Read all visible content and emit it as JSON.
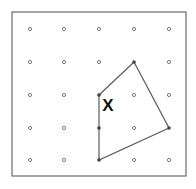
{
  "diagram": {
    "type": "dot-grid-polygon",
    "frame": {
      "x": 12,
      "y": 12,
      "width": 174,
      "height": 164,
      "stroke": "#6a6a6a"
    },
    "grid": {
      "cols": 5,
      "rows": 5,
      "xs": [
        30,
        64,
        99,
        134,
        169
      ],
      "ys": [
        29,
        62,
        95,
        128,
        160
      ],
      "dot_color": "#7a7a7a"
    },
    "polygon": {
      "vertices_grid": [
        [
          2,
          2
        ],
        [
          3,
          1
        ],
        [
          4,
          3
        ],
        [
          2,
          4
        ]
      ],
      "points": "99,95 134,62 169,128 99,160",
      "stroke": "#5a5a5a"
    },
    "filled_dots": [
      [
        99,
        95
      ],
      [
        134,
        62
      ],
      [
        169,
        128
      ],
      [
        99,
        128
      ],
      [
        99,
        160
      ]
    ],
    "marker": {
      "label": "X",
      "x": 108,
      "y": 105,
      "color": "#111111"
    }
  }
}
